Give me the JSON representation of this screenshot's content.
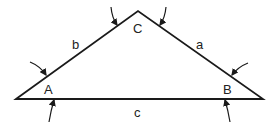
{
  "diagram": {
    "type": "triangle",
    "vertices": [
      {
        "id": "A",
        "label": "A",
        "x": 16,
        "y": 99
      },
      {
        "id": "C",
        "label": "C",
        "x": 138,
        "y": 11
      },
      {
        "id": "B",
        "label": "B",
        "x": 263,
        "y": 99
      }
    ],
    "sides": [
      {
        "id": "a",
        "label": "a",
        "from": "C",
        "to": "B"
      },
      {
        "id": "b",
        "label": "b",
        "from": "A",
        "to": "C"
      },
      {
        "id": "c",
        "label": "c",
        "from": "A",
        "to": "B"
      }
    ],
    "arrow_count": 6,
    "stroke_color": "#1a1a1a"
  }
}
